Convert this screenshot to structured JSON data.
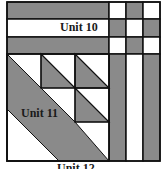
{
  "diagram": {
    "type": "quilt-block-layout",
    "colors": {
      "gray": "#8a8a8a",
      "white": "#ffffff",
      "line": "#111111"
    },
    "labels": {
      "unit10": "Unit 10",
      "unit11": "Unit 11",
      "unit12": "Unit 12"
    }
  }
}
